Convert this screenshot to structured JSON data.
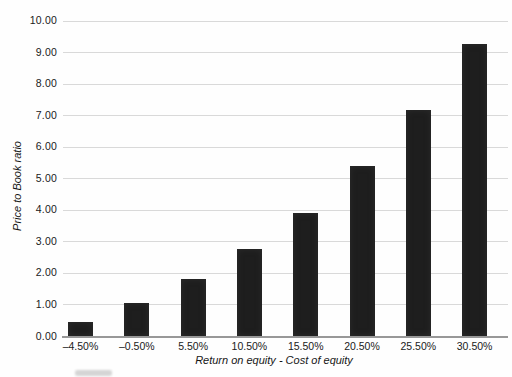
{
  "chart_data": {
    "type": "bar",
    "title": "",
    "categories": [
      "–4.50%",
      "–0.50%",
      "5.50%",
      "10.50%",
      "15.50%",
      "20.50%",
      "25.50%",
      "30.50%"
    ],
    "values": [
      0.45,
      1.05,
      1.8,
      2.75,
      3.9,
      5.4,
      7.15,
      9.25
    ],
    "xlabel": "Return on equity - Cost of equity",
    "ylabel": "Price to Book ratio",
    "ylim": [
      0,
      10
    ],
    "ytick_step": 1,
    "ytick_labels": [
      "0.00",
      "1.00",
      "2.00",
      "3.00",
      "4.00",
      "5.00",
      "6.00",
      "7.00",
      "8.00",
      "9.00",
      "10.00"
    ],
    "grid": "horizontal",
    "legend_position": "none",
    "bar_color": "#1e1e1e",
    "gridline_color": "#d9d9d9"
  }
}
